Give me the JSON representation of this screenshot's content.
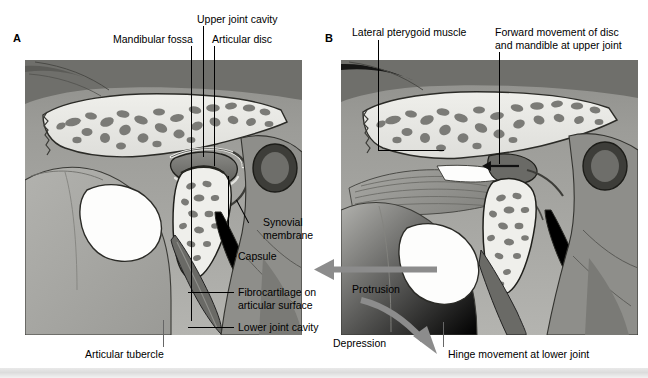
{
  "figure": {
    "panels": [
      {
        "id": "A",
        "letter": "A",
        "caption": "Temporomandibular joint in closed (resting) position"
      },
      {
        "id": "B",
        "letter": "B",
        "caption": "Temporomandibular joint during protrusion and depression"
      }
    ]
  },
  "labels": {
    "panel_a": [
      {
        "key": "mandibular_fossa",
        "text": "Mandibular fossa"
      },
      {
        "key": "upper_joint_cavity",
        "text": "Upper joint cavity"
      },
      {
        "key": "articular_disc",
        "text": "Articular disc"
      },
      {
        "key": "synovial_membrane",
        "text": "Synovial\nmembrane"
      },
      {
        "key": "capsule",
        "text": "Capsule"
      },
      {
        "key": "fibrocartilage",
        "text": "Fibrocartilage on\narticular surface"
      },
      {
        "key": "lower_joint_cavity",
        "text": "Lower joint cavity"
      },
      {
        "key": "articular_tubercle",
        "text": "Articular tubercle"
      }
    ],
    "panel_b": [
      {
        "key": "lateral_pterygoid",
        "text": "Lateral pterygoid muscle"
      },
      {
        "key": "forward_movement",
        "text": "Forward movement of disc\nand mandible at upper joint"
      },
      {
        "key": "hinge_movement",
        "text": "Hinge movement at lower joint"
      }
    ]
  },
  "movements": [
    {
      "key": "protrusion",
      "text": "Protrusion",
      "direction": "left"
    },
    {
      "key": "depression",
      "text": "Depression",
      "direction": "down-right-curved"
    }
  ],
  "colors": {
    "background": "#ffffff",
    "text": "#000000",
    "leader_line": "#000000",
    "arrow": "#8c8c8c",
    "bone_light": "#e8e8e4",
    "bone_mid": "#9a9a96",
    "bone_dark": "#6e6e6a",
    "trabecula": "#7d7d79",
    "soft_tissue": "#a6a6a2",
    "soft_tissue_dark": "#6a6a66",
    "cavity_white": "#fdfdfc",
    "muscle": "#9e9e9a",
    "page_band": "#dcdcdc"
  },
  "icons": {
    "arrow_straight": "arrow-left-icon",
    "arrow_curved": "arrow-curved-down-icon"
  }
}
